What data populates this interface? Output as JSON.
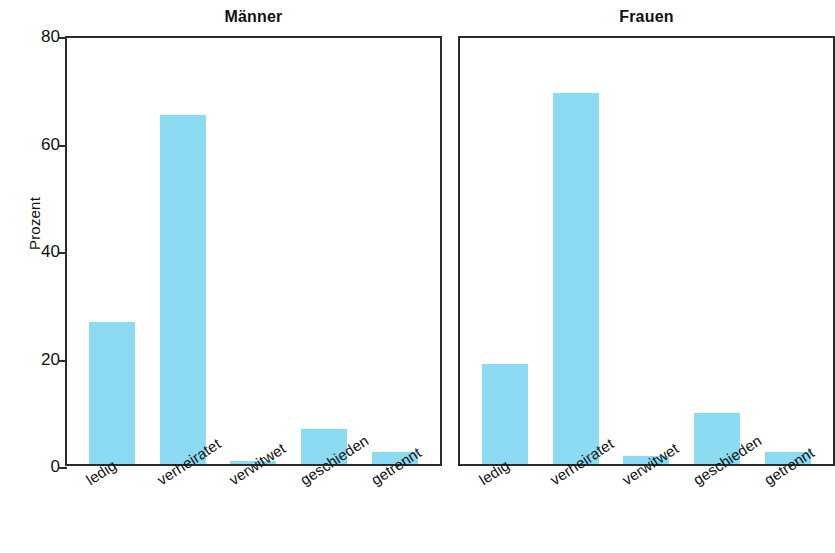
{
  "chart_data": {
    "type": "bar",
    "title": "",
    "xlabel": "",
    "ylabel": "Prozent",
    "ylim": [
      0,
      80
    ],
    "yticks": [
      0,
      20,
      40,
      60,
      80
    ],
    "ytick_labels": [
      "0",
      "20",
      "40",
      "60",
      "80"
    ],
    "grid": false,
    "legend": "none",
    "bar_color": "#8bdcf2",
    "axis_color": "#2b2b2b",
    "categories": [
      "ledig",
      "verheiratet",
      "verwitwet",
      "geschieden",
      "getrennt"
    ],
    "panels": [
      {
        "title": "Männer",
        "values": [
          26.5,
          65.0,
          0.6,
          6.5,
          2.2
        ]
      },
      {
        "title": "Frauen",
        "values": [
          18.6,
          69.0,
          1.5,
          9.5,
          2.3
        ]
      }
    ],
    "series": [
      {
        "name": "Männer",
        "values": [
          26.5,
          65.0,
          0.6,
          6.5,
          2.2
        ]
      },
      {
        "name": "Frauen",
        "values": [
          18.6,
          69.0,
          1.5,
          9.5,
          2.3
        ]
      }
    ]
  }
}
